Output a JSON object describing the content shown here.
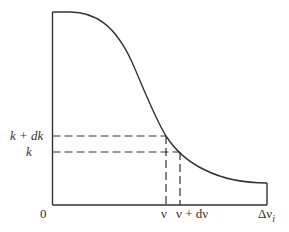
{
  "diagram": {
    "colors": {
      "line": "#333333",
      "background": "#ffffff"
    },
    "labels": {
      "origin": "0",
      "y_upper": "k + dk",
      "y_lower": "k",
      "x_nu": "ν",
      "x_nu_plus": "ν + dν",
      "x_end": "Δν",
      "x_end_sub": "i"
    }
  }
}
